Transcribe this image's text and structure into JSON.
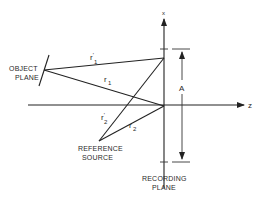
{
  "diagram": {
    "type": "holography-recording-geometry",
    "axes": {
      "vertical_label": "x",
      "horizontal_label": "z"
    },
    "labels": {
      "object_plane_line1": "OBJECT",
      "object_plane_line2": "PLANE",
      "reference_source_line1": "REFERENCE",
      "reference_source_line2": "SOURCE",
      "recording_plane_line1": "RECORDING",
      "recording_plane_line2": "PLANE",
      "aperture": "A"
    },
    "rays": {
      "r1_prime": {
        "base": "r",
        "sub": "1",
        "prime": "'"
      },
      "r1": {
        "base": "r",
        "sub": "1"
      },
      "r2_prime": {
        "base": "r",
        "sub": "2",
        "prime": "'"
      },
      "r2": {
        "base": "r",
        "sub": "2"
      }
    },
    "colors": {
      "line": "#222222",
      "background": "#ffffff"
    }
  }
}
